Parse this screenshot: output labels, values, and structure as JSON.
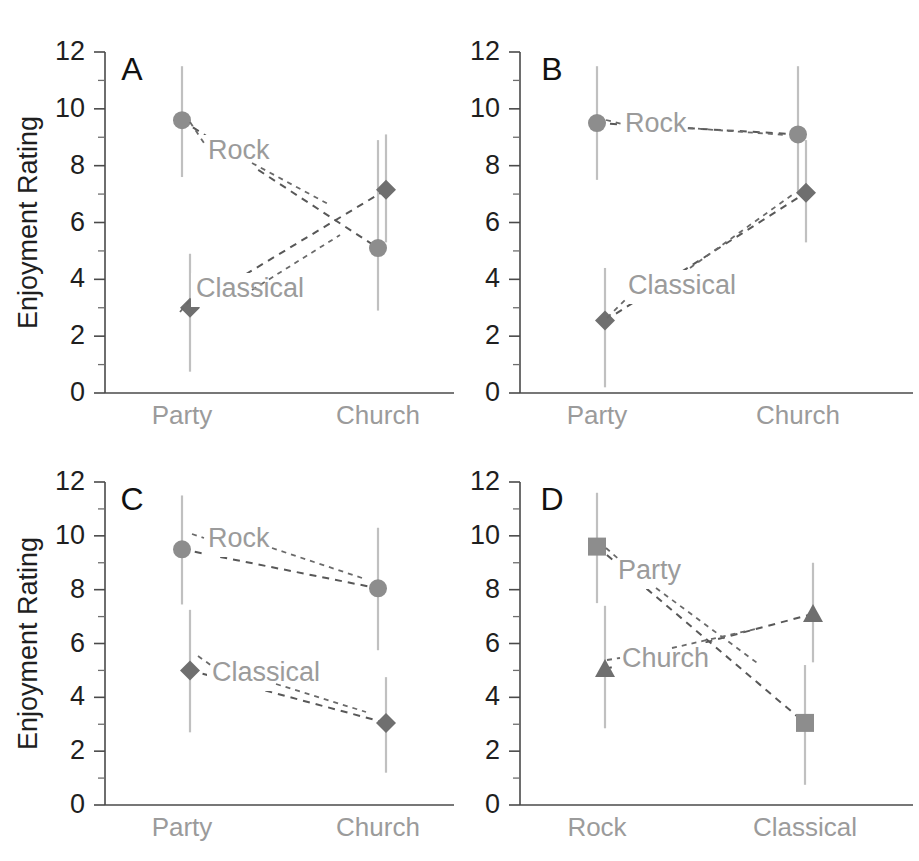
{
  "figure": {
    "width": 919,
    "height": 861,
    "background": "#ffffff",
    "panel_letters": [
      "A",
      "B",
      "C",
      "D"
    ],
    "y_axis_title": "Enjoyment Rating",
    "colors": {
      "marker": "#8d8d8d",
      "marker_dark": "#6f6f6f",
      "error_bar": "#c0c0c0",
      "series_line": "#585858",
      "tick_text": "#1f1f1f",
      "category_text": "#9b9b9b",
      "series_label_text": "#9b9b9b",
      "axis": "#4a4a4a"
    }
  },
  "chart_data": [
    {
      "panel": "A",
      "type": "line",
      "title": "A",
      "xlabel": "",
      "ylabel": "Enjoyment Rating",
      "categories": [
        "Party",
        "Church"
      ],
      "ylim": [
        0,
        12
      ],
      "yticks": [
        0,
        2,
        4,
        6,
        8,
        10,
        12
      ],
      "yticks_minor": [
        1,
        3,
        5,
        7,
        9,
        11
      ],
      "ytick_labels": [
        "0",
        "2",
        "4",
        "6",
        "8",
        "10",
        "12"
      ],
      "grid": false,
      "legend": "inline-annotations",
      "series": [
        {
          "name": "Rock",
          "marker": "circle",
          "values": [
            9.6,
            5.1
          ],
          "error_low": [
            7.6,
            2.9
          ],
          "error_high": [
            11.5,
            8.9
          ]
        },
        {
          "name": "Classical",
          "marker": "diamond",
          "values": [
            3.0,
            7.15
          ],
          "error_low": [
            0.75,
            5.3
          ],
          "error_high": [
            4.9,
            9.1
          ]
        }
      ]
    },
    {
      "panel": "B",
      "type": "line",
      "title": "B",
      "xlabel": "",
      "ylabel": "",
      "categories": [
        "Party",
        "Church"
      ],
      "ylim": [
        0,
        12
      ],
      "yticks": [
        0,
        2,
        4,
        6,
        8,
        10,
        12
      ],
      "yticks_minor": [
        1,
        3,
        5,
        7,
        9,
        11
      ],
      "ytick_labels": [
        "0",
        "2",
        "4",
        "6",
        "8",
        "10",
        "12"
      ],
      "grid": false,
      "legend": "inline-annotations",
      "series": [
        {
          "name": "Rock",
          "marker": "circle",
          "values": [
            9.5,
            9.1
          ],
          "error_low": [
            7.5,
            7.0
          ],
          "error_high": [
            11.5,
            11.5
          ]
        },
        {
          "name": "Classical",
          "marker": "diamond",
          "values": [
            2.55,
            7.05
          ],
          "error_low": [
            0.2,
            5.3
          ],
          "error_high": [
            4.4,
            8.9
          ]
        }
      ]
    },
    {
      "panel": "C",
      "type": "line",
      "title": "C",
      "xlabel": "",
      "ylabel": "Enjoyment Rating",
      "categories": [
        "Party",
        "Church"
      ],
      "ylim": [
        0,
        12
      ],
      "yticks": [
        0,
        2,
        4,
        6,
        8,
        10,
        12
      ],
      "yticks_minor": [
        1,
        3,
        5,
        7,
        9,
        11
      ],
      "ytick_labels": [
        "0",
        "2",
        "4",
        "6",
        "8",
        "10",
        "12"
      ],
      "grid": false,
      "legend": "inline-annotations",
      "series": [
        {
          "name": "Rock",
          "marker": "circle",
          "values": [
            9.5,
            8.05
          ],
          "error_low": [
            7.45,
            5.75
          ],
          "error_high": [
            11.5,
            10.3
          ]
        },
        {
          "name": "Classical",
          "marker": "diamond",
          "values": [
            5.0,
            3.05
          ],
          "error_low": [
            2.7,
            1.2
          ],
          "error_high": [
            7.25,
            4.75
          ]
        }
      ]
    },
    {
      "panel": "D",
      "type": "line",
      "title": "D",
      "xlabel": "",
      "ylabel": "",
      "categories": [
        "Rock",
        "Classical"
      ],
      "ylim": [
        0,
        12
      ],
      "yticks": [
        0,
        2,
        4,
        6,
        8,
        10,
        12
      ],
      "yticks_minor": [
        1,
        3,
        5,
        7,
        9,
        11
      ],
      "ytick_labels": [
        "0",
        "2",
        "4",
        "6",
        "8",
        "10",
        "12"
      ],
      "grid": false,
      "legend": "inline-annotations",
      "series": [
        {
          "name": "Party",
          "marker": "square",
          "values": [
            9.6,
            3.05
          ],
          "error_low": [
            7.5,
            0.75
          ],
          "error_high": [
            11.6,
            5.2
          ]
        },
        {
          "name": "Church",
          "marker": "triangle",
          "values": [
            5.05,
            7.1
          ],
          "error_low": [
            2.85,
            5.3
          ],
          "error_high": [
            7.4,
            9.0
          ]
        }
      ]
    }
  ]
}
